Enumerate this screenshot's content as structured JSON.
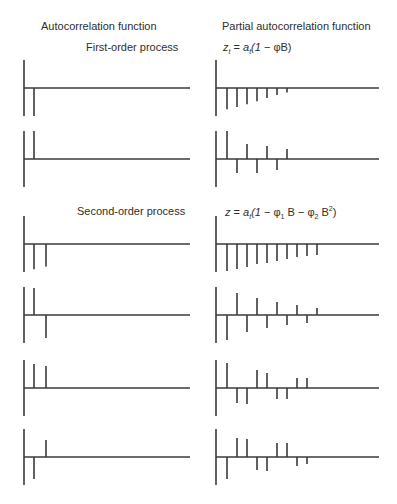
{
  "headers": {
    "acf": "Autocorrelation function",
    "pacf": "Partial autocorrelation function"
  },
  "sections": [
    {
      "label": "First-order process",
      "formula": "z_t = a_t(1 − φB)"
    },
    {
      "label": "Second-order process",
      "formula": "z = a_t(1 − φ_1B − φ_2B²)"
    }
  ],
  "colors": {
    "line": "#3a3a3a",
    "background": "#ffffff"
  },
  "chart_data": [
    {
      "type": "bar",
      "panel": "first-order-1",
      "function": "ACF",
      "lags": [
        1
      ],
      "values": [
        -1.0
      ]
    },
    {
      "type": "bar",
      "panel": "first-order-1",
      "function": "PACF",
      "lags": [
        1,
        2,
        3,
        4,
        5,
        6,
        7
      ],
      "values": [
        -0.76,
        -0.68,
        -0.58,
        -0.47,
        -0.36,
        -0.25,
        -0.16
      ]
    },
    {
      "type": "bar",
      "panel": "first-order-2",
      "function": "ACF",
      "lags": [
        1
      ],
      "values": [
        1.0
      ]
    },
    {
      "type": "bar",
      "panel": "first-order-2",
      "function": "PACF",
      "lags": [
        1,
        2,
        3,
        4,
        5,
        6,
        7
      ],
      "values": [
        1.0,
        -0.5,
        0.54,
        -0.5,
        0.46,
        -0.39,
        0.36
      ]
    },
    {
      "type": "bar",
      "panel": "second-order-1",
      "function": "ACF",
      "lags": [
        1,
        2
      ],
      "values": [
        -0.9,
        -0.8
      ]
    },
    {
      "type": "bar",
      "panel": "second-order-1",
      "function": "PACF",
      "lags": [
        1,
        2,
        3,
        4,
        5,
        6,
        7,
        8,
        9,
        10
      ],
      "values": [
        -0.96,
        -0.89,
        -0.82,
        -0.71,
        -0.68,
        -0.61,
        -0.54,
        -0.46,
        -0.43,
        -0.39
      ]
    },
    {
      "type": "bar",
      "panel": "second-order-2",
      "function": "ACF",
      "lags": [
        1,
        2
      ],
      "values": [
        0.96,
        -0.82
      ]
    },
    {
      "type": "bar",
      "panel": "second-order-2",
      "function": "PACF",
      "lags": [
        1,
        2,
        3,
        4,
        5,
        6,
        7,
        8,
        9,
        10
      ],
      "values": [
        -0.89,
        0.79,
        -0.61,
        0.61,
        -0.46,
        0.46,
        -0.36,
        0.36,
        -0.29,
        0.25
      ]
    },
    {
      "type": "bar",
      "panel": "second-order-3",
      "function": "ACF",
      "lags": [
        1,
        2
      ],
      "values": [
        0.86,
        0.79
      ]
    },
    {
      "type": "bar",
      "panel": "second-order-3",
      "function": "PACF",
      "lags": [
        1,
        2,
        3,
        4,
        5,
        6,
        7,
        8,
        9
      ],
      "values": [
        0.89,
        -0.54,
        -0.57,
        0.64,
        0.54,
        -0.39,
        -0.39,
        0.36,
        0.36
      ]
    },
    {
      "type": "bar",
      "panel": "second-order-4",
      "function": "ACF",
      "lags": [
        1,
        2
      ],
      "values": [
        -0.79,
        0.61
      ]
    },
    {
      "type": "bar",
      "panel": "second-order-4",
      "function": "PACF",
      "lags": [
        1,
        2,
        3,
        4,
        5,
        6,
        7,
        8,
        9
      ],
      "values": [
        -0.79,
        0.68,
        0.64,
        -0.46,
        -0.5,
        0.5,
        0.5,
        -0.32,
        -0.25
      ]
    }
  ],
  "layout": {
    "panel_baselines": [
      88,
      159,
      244,
      315,
      388,
      457
    ],
    "acf_axis_x": 24,
    "acf_first_lag_x": 34,
    "acf_lag_spacing": 12,
    "acf_end_x": 190,
    "pacf_axis_x": 216,
    "pacf_first_lag_x": 227,
    "pacf_lag_spacing": 10,
    "pacf_end_x": 379,
    "axis_half_height": 28
  }
}
